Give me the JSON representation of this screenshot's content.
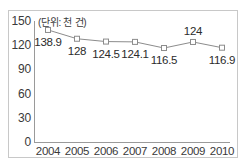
{
  "chart_data": {
    "type": "line",
    "title": "",
    "subtitle": "",
    "unit_caption": "(단위: 천 건)",
    "xlabel": "",
    "ylabel": "",
    "categories": [
      "2004",
      "2005",
      "2006",
      "2007",
      "2008",
      "2009",
      "2010"
    ],
    "values": [
      138.9,
      128,
      124.5,
      124.1,
      116.5,
      124,
      116.9
    ],
    "point_labels": [
      "138.9",
      "128",
      "124.5",
      "124.1",
      "116.5",
      "124",
      "116.9"
    ],
    "label_positions": [
      "below",
      "below",
      "below",
      "below",
      "below",
      "above",
      "below"
    ],
    "series": [
      {
        "name": "건수",
        "values": [
          138.9,
          128,
          124.5,
          124.1,
          116.5,
          124,
          116.9
        ]
      }
    ],
    "ylim": [
      0,
      150
    ],
    "yticks": [
      0,
      30,
      60,
      90,
      120,
      150
    ],
    "ytick_labels": [
      "0",
      "30",
      "60",
      "90",
      "120",
      "150"
    ],
    "xtick_labels": [
      "2004",
      "2005",
      "2006",
      "2007",
      "2008",
      "2009",
      "2010"
    ],
    "grid": false,
    "legend": false,
    "legend_position": "none",
    "marker": "open-square",
    "line_color": "#8c8c8c",
    "marker_color": "#8c8c8c",
    "axis_color": "#9a9a9a",
    "text_color": "#3a3a3a",
    "frame_color": "#c8c8c8",
    "background_color": "#ffffff"
  }
}
